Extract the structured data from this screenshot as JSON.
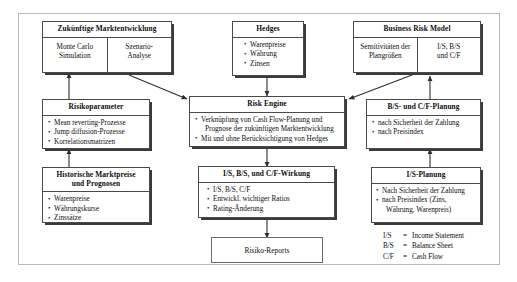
{
  "diagram": {
    "title_hidden": "",
    "boxes": {
      "zukuenftige": {
        "header": "Zukünftige Marktentwicklung",
        "left_cell": "Monte Carlo\nSimulation",
        "right_cell": "Szenario-\nAnalyse"
      },
      "hedges": {
        "header": "Hedges",
        "items": [
          "Warenpreise",
          "Währung",
          "Zinsen"
        ]
      },
      "business_risk_model": {
        "header": "Business Risk Model",
        "left_cell": "Sensitivitäten der\nPlangrößen",
        "right_cell": "I/S, B/S\nund C/F"
      },
      "risikoparameter": {
        "header": "Risikoparameter",
        "items": [
          "Mean reverting-Prozesse",
          "Jump diffusion-Prozesse",
          "Korrelationsmatrizen"
        ]
      },
      "risk_engine": {
        "header": "Risk Engine",
        "items": [
          "Verknüpfung von Cash Flow-Planung und",
          "Prognose der zukünftigen Marktentwicklung",
          "Mit und ohne Berücksichtigung von Hedges"
        ]
      },
      "bs_cf_planung": {
        "header": "B/S- und C/F-Planung",
        "items": [
          "nach Sicherheit der Zahlung",
          "nach Preisindex"
        ]
      },
      "historische": {
        "header": "Historische Marktpreise\nund Prognosen",
        "items": [
          "Warenpreise",
          "Währungskurse",
          "Zinssätze"
        ]
      },
      "wirkung": {
        "header": "I/S, B/S, und C/F-Wirkung",
        "items": [
          "I/S, B/S, C/F",
          "Entwickl. wichtiger Ratios",
          "Rating-Änderung"
        ]
      },
      "is_planung": {
        "header": "I/S-Planung",
        "items": [
          "Nach Sicherheit der Zahlung",
          "nach Preisindex (Zins,",
          "Währung, Warenpreis)"
        ]
      },
      "risiko_reports": {
        "label": "Risiko-Reports"
      }
    },
    "legend": [
      {
        "key": "I/S",
        "eq": "=",
        "value": "Income Statement"
      },
      {
        "key": "B/S",
        "eq": "=",
        "value": "Balance Sheet"
      },
      {
        "key": "C/F",
        "eq": "=",
        "value": "Cash Flow"
      }
    ],
    "colors": {
      "box_border": "#4a4a4a",
      "frame_border": "#b9b9b9",
      "shadow": "#3a3a3a",
      "text": "#0d0d0d",
      "background": "#ffffff"
    }
  }
}
